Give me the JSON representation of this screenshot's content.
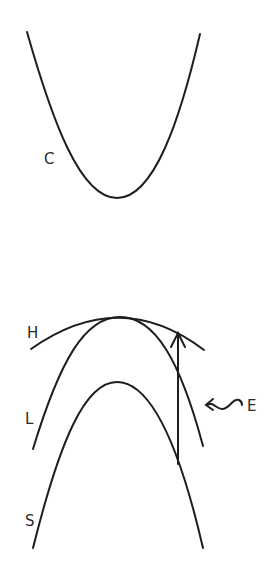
{
  "diagram": {
    "type": "energy-band-diagram",
    "background": "#ffffff",
    "stroke_color": "#1e1e1e",
    "labels": {
      "conduction_band": "C",
      "heavy_hole_band": "H",
      "light_hole_band": "L",
      "split_off_band": "S",
      "photon": "E"
    },
    "elements": [
      {
        "name": "conduction-band-curve",
        "label": "C",
        "shape": "upward parabola"
      },
      {
        "name": "heavy-hole-band-curve",
        "label": "H",
        "shape": "downward parabola (flat)"
      },
      {
        "name": "light-hole-band-curve",
        "label": "L",
        "shape": "downward parabola (steep)"
      },
      {
        "name": "split-off-band-curve",
        "label": "S",
        "shape": "downward parabola (lower)"
      },
      {
        "name": "transition-arrow",
        "from": "S",
        "to": "H",
        "direction": "vertical upward"
      },
      {
        "name": "photon-wavy-arrow",
        "label": "E",
        "direction": "leftward"
      }
    ]
  }
}
